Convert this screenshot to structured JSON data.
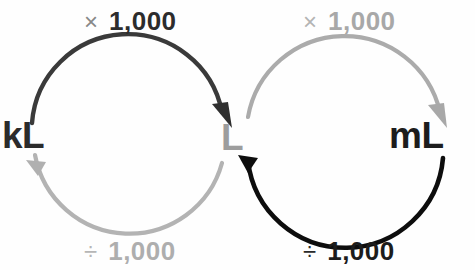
{
  "diagram": {
    "background_color": "#fefefe",
    "units": {
      "left": {
        "label": "kL",
        "color": "#2b2b2b"
      },
      "center": {
        "label": "L",
        "color": "#9d9d9d"
      },
      "right": {
        "label": "mL",
        "color": "#1d1d1d"
      }
    },
    "operations": {
      "top_left": {
        "symbol": "×",
        "symbol_name": "multiply-sign",
        "value": "1,000",
        "symbol_color": "#888888",
        "value_color": "#2c2c2c"
      },
      "top_right": {
        "symbol": "×",
        "symbol_name": "multiply-sign",
        "value": "1,000",
        "symbol_color": "#b4b4b4",
        "value_color": "#a8a8a8"
      },
      "bottom_left": {
        "symbol": "÷",
        "symbol_name": "divide-sign",
        "value": "1,000",
        "symbol_color": "#b6b6b6",
        "value_color": "#aeaeae"
      },
      "bottom_right": {
        "symbol": "÷",
        "symbol_name": "divide-sign",
        "value": "1,000",
        "symbol_color": "#2a2a2a",
        "value_color": "#1c1c1c"
      }
    },
    "arrows": {
      "kl_to_l": {
        "from": "kL",
        "to": "L",
        "color": "#3a3a3a",
        "operation": "× 1,000"
      },
      "l_to_kl": {
        "from": "L",
        "to": "kL",
        "color": "#b0b0b0",
        "operation": "÷ 1,000"
      },
      "l_to_ml": {
        "from": "L",
        "to": "mL",
        "color": "#aaaaaa",
        "operation": "× 1,000"
      },
      "ml_to_l": {
        "from": "mL",
        "to": "L",
        "color": "#0d0d0d",
        "operation": "÷ 1,000"
      }
    }
  }
}
